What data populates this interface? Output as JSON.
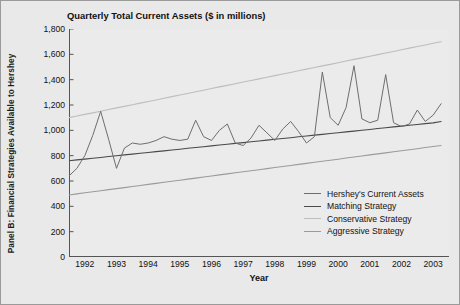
{
  "panel": {
    "label": "Panel B: Financial Strategies Available to Hershey"
  },
  "colors": {
    "background": "#e9e9e9",
    "plot_background": "#ebebeb",
    "axis": "#555555",
    "hershey": "#6e6e6e",
    "matching": "#4a4a4a",
    "conservative": "#bdbdbd",
    "aggressive": "#9b9b9b",
    "text": "#111111"
  },
  "legend": {
    "position": "inside-bottom-right",
    "entries": [
      {
        "label": "Hershey's Current Assets",
        "color": "#6e6e6e"
      },
      {
        "label": "Matching Strategy",
        "color": "#4a4a4a"
      },
      {
        "label": "Conservative Strategy",
        "color": "#bdbdbd"
      },
      {
        "label": "Aggressive Strategy",
        "color": "#9b9b9b"
      }
    ]
  },
  "chart_data": {
    "type": "line",
    "title": "Quarterly Total Current Assets ($ in millions)",
    "xlabel": "Year",
    "ylabel": "",
    "ylim": [
      0,
      1800
    ],
    "yticks": [
      0,
      200,
      400,
      600,
      800,
      1000,
      1200,
      1400,
      1600,
      1800
    ],
    "ytick_labels": [
      "0",
      "200",
      "400",
      "600",
      "800",
      "1,000",
      "1,200",
      "1,400",
      "1,600",
      "1,800"
    ],
    "xlim": [
      1992,
      2004
    ],
    "xticks": [
      1992,
      1993,
      1994,
      1995,
      1996,
      1997,
      1998,
      1999,
      2000,
      2001,
      2002,
      2003
    ],
    "xtick_labels": [
      "1992",
      "1993",
      "1994",
      "1995",
      "1996",
      "1997",
      "1998",
      "1999",
      "2000",
      "2001",
      "2002",
      "2003"
    ],
    "x_minor_tick_interval_quarters": 1,
    "grid": false,
    "x": [
      1992.0,
      1992.25,
      1992.5,
      1992.75,
      1993.0,
      1993.25,
      1993.5,
      1993.75,
      1994.0,
      1994.25,
      1994.5,
      1994.75,
      1995.0,
      1995.25,
      1995.5,
      1995.75,
      1996.0,
      1996.25,
      1996.5,
      1996.75,
      1997.0,
      1997.25,
      1997.5,
      1997.75,
      1998.0,
      1998.25,
      1998.5,
      1998.75,
      1999.0,
      1999.25,
      1999.5,
      1999.75,
      2000.0,
      2000.25,
      2000.5,
      2000.75,
      2001.0,
      2001.25,
      2001.5,
      2001.75,
      2002.0,
      2002.25,
      2002.5,
      2002.75,
      2003.0,
      2003.25,
      2003.5,
      2003.75
    ],
    "series": [
      {
        "name": "Hershey's Current Assets",
        "color": "#6e6e6e",
        "values": [
          640,
          700,
          800,
          960,
          1150,
          930,
          700,
          860,
          900,
          890,
          900,
          920,
          950,
          930,
          920,
          930,
          1080,
          950,
          920,
          1000,
          1050,
          900,
          880,
          940,
          1040,
          980,
          920,
          1010,
          1070,
          990,
          900,
          950,
          1460,
          1100,
          1040,
          1180,
          1510,
          1090,
          1060,
          1080,
          1440,
          1060,
          1030,
          1050,
          1160,
          1070,
          1120,
          1210
        ]
      },
      {
        "name": "Matching Strategy",
        "color": "#4a4a4a",
        "trend_line": true,
        "start_value": 760,
        "end_value": 1070,
        "values": [
          760,
          767,
          773,
          780,
          786,
          793,
          799,
          806,
          812,
          819,
          825,
          832,
          838,
          845,
          851,
          858,
          864,
          871,
          877,
          884,
          890,
          897,
          903,
          910,
          916,
          923,
          929,
          936,
          942,
          949,
          955,
          962,
          968,
          975,
          981,
          988,
          994,
          1001,
          1007,
          1014,
          1020,
          1027,
          1033,
          1040,
          1046,
          1053,
          1059,
          1070
        ]
      },
      {
        "name": "Conservative Strategy",
        "color": "#bdbdbd",
        "trend_line": true,
        "start_value": 1100,
        "end_value": 1700,
        "values": [
          1100,
          1113,
          1126,
          1138,
          1151,
          1164,
          1177,
          1189,
          1202,
          1215,
          1228,
          1240,
          1253,
          1266,
          1279,
          1291,
          1304,
          1317,
          1330,
          1343,
          1355,
          1368,
          1381,
          1394,
          1406,
          1419,
          1432,
          1445,
          1457,
          1470,
          1483,
          1496,
          1509,
          1521,
          1534,
          1547,
          1560,
          1572,
          1585,
          1598,
          1611,
          1623,
          1636,
          1649,
          1662,
          1674,
          1687,
          1700
        ]
      },
      {
        "name": "Aggressive Strategy",
        "color": "#9b9b9b",
        "trend_line": true,
        "start_value": 490,
        "end_value": 880,
        "values": [
          490,
          498,
          507,
          515,
          523,
          532,
          540,
          548,
          557,
          565,
          573,
          581,
          590,
          598,
          606,
          615,
          623,
          631,
          640,
          648,
          656,
          665,
          673,
          681,
          689,
          698,
          706,
          714,
          723,
          731,
          739,
          748,
          756,
          764,
          772,
          781,
          789,
          797,
          806,
          814,
          822,
          831,
          839,
          847,
          855,
          864,
          872,
          880
        ]
      }
    ]
  }
}
